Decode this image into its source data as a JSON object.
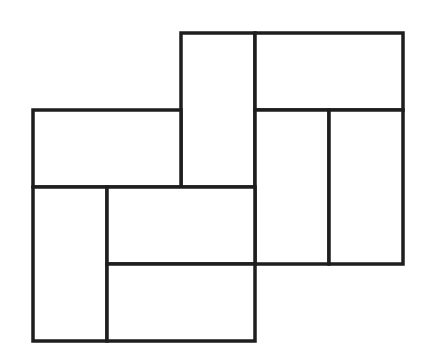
{
  "diagram": {
    "title": "",
    "grid_unit_px": 74,
    "stroke_color": "#1e1e1e",
    "fill_color": "#ffffff",
    "background_color": "#ffffff",
    "tiles": [
      {
        "id": "t1",
        "x": 181,
        "y": 33,
        "w": 74,
        "h": 154
      },
      {
        "id": "t2",
        "x": 255,
        "y": 33,
        "w": 148,
        "h": 77
      },
      {
        "id": "t3",
        "x": 33,
        "y": 110,
        "w": 148,
        "h": 77
      },
      {
        "id": "t4",
        "x": 255,
        "y": 110,
        "w": 74,
        "h": 154
      },
      {
        "id": "t5",
        "x": 329,
        "y": 110,
        "w": 74,
        "h": 154
      },
      {
        "id": "t6",
        "x": 33,
        "y": 187,
        "w": 74,
        "h": 154
      },
      {
        "id": "t7",
        "x": 107,
        "y": 187,
        "w": 148,
        "h": 77
      },
      {
        "id": "t8",
        "x": 107,
        "y": 264,
        "w": 148,
        "h": 77
      }
    ]
  }
}
